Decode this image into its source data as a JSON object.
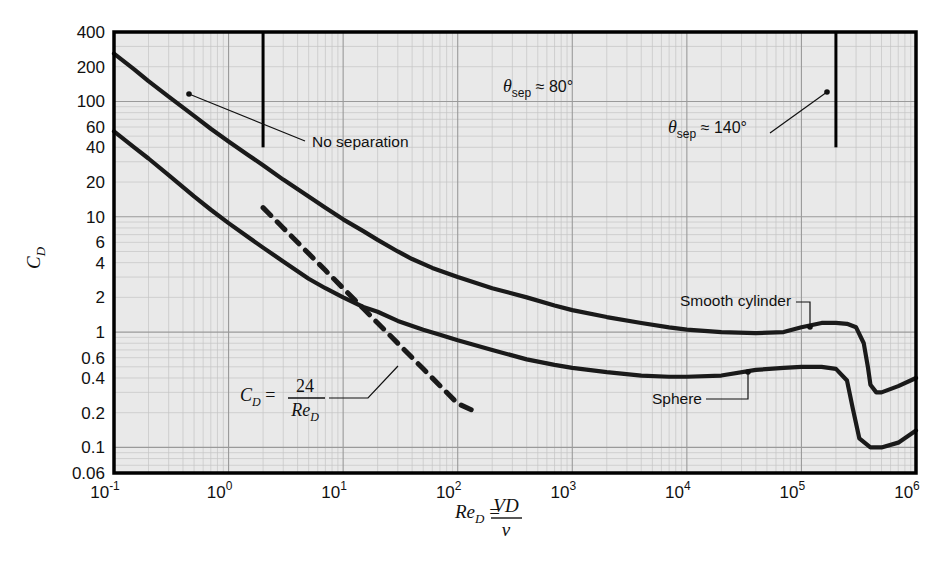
{
  "figure": {
    "background": "#ffffff",
    "plot_background": "#e9e9e9",
    "frame_color": "#000000",
    "grid_major_color": "#9a9a9a",
    "grid_minor_color": "#c4c4c4",
    "curve_color": "#1a1a1a"
  },
  "axes": {
    "y_title": "C",
    "y_title_sub": "D",
    "x_title_lead": "Re",
    "x_title_sub": "D",
    "x_title_eq": " = ",
    "x_title_num": "VD",
    "x_title_den": "ν",
    "y_tick_labels": [
      "400",
      "200",
      "100",
      "60",
      "40",
      "20",
      "10",
      "6",
      "4",
      "2",
      "1",
      "0.6",
      "0.4",
      "0.2",
      "0.1",
      "0.06"
    ],
    "x_tick_labels": [
      "10",
      "10",
      "10",
      "10",
      "10",
      "10",
      "10",
      "10"
    ],
    "x_tick_exponents": [
      "-1",
      "0",
      "1",
      "2",
      "3",
      "4",
      "5",
      "6"
    ]
  },
  "annotations": {
    "no_separation": "No separation",
    "theta_sep_80": {
      "symbol": "θ",
      "sub": "sep",
      "value": " ≈ 80°"
    },
    "theta_sep_140": {
      "symbol": "θ",
      "sub": "sep",
      "value": " ≈ 140°"
    },
    "stokes": {
      "lhs": "C",
      "lhs_sub": "D",
      "eq": " = ",
      "num": "24",
      "den_lead": "Re",
      "den_sub": "D"
    },
    "smooth_cylinder": "Smooth cylinder",
    "sphere": "Sphere"
  },
  "chart_data": {
    "type": "line",
    "title": "",
    "xlabel": "Re_D = VD/ν",
    "ylabel": "C_D",
    "xscale": "log",
    "yscale": "log",
    "xlim": [
      0.1,
      1000000
    ],
    "ylim": [
      0.06,
      400
    ],
    "grid": true,
    "legend": "inline-labels",
    "series": [
      {
        "name": "Smooth cylinder",
        "style": "solid",
        "points": [
          [
            0.1,
            260
          ],
          [
            0.15,
            190
          ],
          [
            0.2,
            150
          ],
          [
            0.3,
            110
          ],
          [
            0.5,
            75
          ],
          [
            0.7,
            58
          ],
          [
            1.0,
            45
          ],
          [
            1.5,
            34
          ],
          [
            2.0,
            28
          ],
          [
            3.0,
            21
          ],
          [
            5.0,
            15
          ],
          [
            7.0,
            12
          ],
          [
            10,
            9.5
          ],
          [
            15,
            7.5
          ],
          [
            20,
            6.3
          ],
          [
            30,
            5.0
          ],
          [
            40,
            4.3
          ],
          [
            60,
            3.6
          ],
          [
            100,
            3.0
          ],
          [
            200,
            2.4
          ],
          [
            400,
            2.0
          ],
          [
            700,
            1.7
          ],
          [
            1000,
            1.55
          ],
          [
            2000,
            1.35
          ],
          [
            4000,
            1.2
          ],
          [
            7000,
            1.1
          ],
          [
            10000,
            1.05
          ],
          [
            20000,
            1.0
          ],
          [
            40000,
            0.98
          ],
          [
            70000,
            1.0
          ],
          [
            100000,
            1.1
          ],
          [
            150000,
            1.2
          ],
          [
            200000,
            1.2
          ],
          [
            250000,
            1.18
          ],
          [
            300000,
            1.1
          ],
          [
            350000,
            0.8
          ],
          [
            380000,
            0.5
          ],
          [
            400000,
            0.35
          ],
          [
            450000,
            0.3
          ],
          [
            500000,
            0.3
          ],
          [
            700000,
            0.34
          ],
          [
            1000000,
            0.4
          ]
        ]
      },
      {
        "name": "Sphere",
        "style": "solid",
        "points": [
          [
            0.1,
            55
          ],
          [
            0.15,
            40
          ],
          [
            0.2,
            32
          ],
          [
            0.3,
            23
          ],
          [
            0.5,
            15
          ],
          [
            0.7,
            11.5
          ],
          [
            1.0,
            8.8
          ],
          [
            1.5,
            6.6
          ],
          [
            2.0,
            5.4
          ],
          [
            3.0,
            4.1
          ],
          [
            5.0,
            2.9
          ],
          [
            7.0,
            2.4
          ],
          [
            10,
            2.0
          ],
          [
            15,
            1.65
          ],
          [
            20,
            1.5
          ],
          [
            30,
            1.25
          ],
          [
            50,
            1.05
          ],
          [
            70,
            0.95
          ],
          [
            100,
            0.85
          ],
          [
            200,
            0.7
          ],
          [
            400,
            0.58
          ],
          [
            700,
            0.52
          ],
          [
            1000,
            0.49
          ],
          [
            2000,
            0.45
          ],
          [
            4000,
            0.42
          ],
          [
            7000,
            0.41
          ],
          [
            10000,
            0.41
          ],
          [
            20000,
            0.42
          ],
          [
            40000,
            0.47
          ],
          [
            70000,
            0.49
          ],
          [
            100000,
            0.5
          ],
          [
            150000,
            0.5
          ],
          [
            200000,
            0.48
          ],
          [
            250000,
            0.38
          ],
          [
            280000,
            0.22
          ],
          [
            320000,
            0.12
          ],
          [
            400000,
            0.1
          ],
          [
            500000,
            0.1
          ],
          [
            700000,
            0.11
          ],
          [
            1000000,
            0.14
          ]
        ]
      },
      {
        "name": "C_D = 24/Re_D",
        "style": "dashed",
        "points": [
          [
            2.0,
            12
          ],
          [
            3.0,
            8.0
          ],
          [
            5.0,
            4.8
          ],
          [
            7.0,
            3.43
          ],
          [
            10,
            2.4
          ],
          [
            15,
            1.6
          ],
          [
            20,
            1.2
          ],
          [
            30,
            0.8
          ],
          [
            50,
            0.48
          ],
          [
            70,
            0.343
          ],
          [
            100,
            0.24
          ],
          [
            150,
            0.2
          ]
        ]
      }
    ],
    "vertical_dividers": [
      {
        "x": 2.0,
        "y_top": 400,
        "y_bottom": 40
      },
      {
        "x": 200000,
        "y_top": 400,
        "y_bottom": 40
      }
    ]
  }
}
